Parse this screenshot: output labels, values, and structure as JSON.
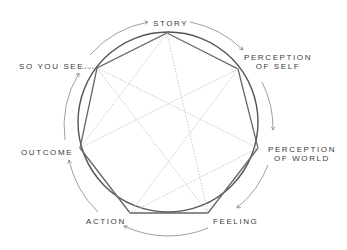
{
  "diagram": {
    "type": "enneagram-style heptagon cycle",
    "nodes": [
      {
        "id": "story",
        "label": "STORY"
      },
      {
        "id": "perception-self",
        "label_line1": "PERCEPTION",
        "label_line2": "OF SELF"
      },
      {
        "id": "perception-world",
        "label_line1": "PERCEPTION",
        "label_line2": "OF WORLD"
      },
      {
        "id": "feeling",
        "label": "FEELING"
      },
      {
        "id": "action",
        "label": "ACTION"
      },
      {
        "id": "outcome",
        "label": "OUTCOME"
      },
      {
        "id": "so-you-see",
        "label": "SO YOU SEE...."
      }
    ],
    "flow": "clockwise",
    "colors": {
      "stroke": "#555555",
      "star": "#b8b8b8",
      "text": "#3a3a3a",
      "background": "#ffffff"
    }
  }
}
